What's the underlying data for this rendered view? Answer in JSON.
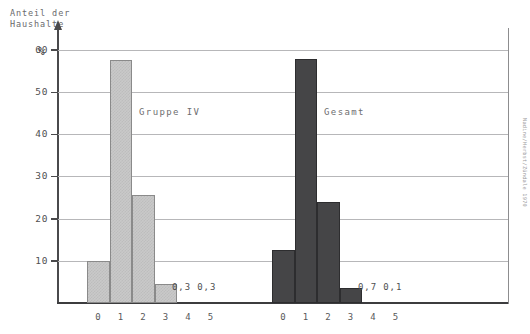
{
  "axis": {
    "y_title_line1": "Anteil der",
    "y_title_line2": "Haushalte",
    "y_unit": "%",
    "y_ticks": [
      "60",
      "50",
      "40",
      "30",
      "20",
      "10"
    ],
    "x_ticks": [
      "0",
      "1",
      "2",
      "3",
      "4",
      "5"
    ]
  },
  "groups": {
    "left": {
      "label": "Gruppe IV",
      "small_values_text": "0,3  0,3"
    },
    "right": {
      "label": "Gesamt",
      "small_values_text": "0,7  0,1"
    }
  },
  "credit": "Nadine/Herbst/Zündale 1970",
  "colors": {
    "light_bar": "#c9c9c9",
    "light_bar_border": "#8a8a8a",
    "dark_bar": "#454547",
    "dark_bar_border": "#2d2d2f",
    "gridline": "#b7b7b9",
    "axis": "#4a4a4c",
    "text": "#58585a"
  },
  "chart_data": {
    "type": "bar",
    "title": "",
    "xlabel": "",
    "ylabel": "Anteil der Haushalte %",
    "ylim": [
      0,
      62
    ],
    "grid": true,
    "legend_position": "inline-annotation",
    "categories": [
      "0",
      "1",
      "2",
      "3",
      "4",
      "5"
    ],
    "series": [
      {
        "name": "Gruppe IV",
        "values": [
          10.0,
          57.5,
          25.5,
          4.5,
          0.3,
          0.3
        ],
        "color": "#c9c9c9",
        "annotations": [
          "",
          "",
          "",
          "",
          "0,3",
          "0,3"
        ]
      },
      {
        "name": "Gesamt",
        "values": [
          12.5,
          57.8,
          24.0,
          3.5,
          0.7,
          0.1
        ],
        "color": "#454547",
        "annotations": [
          "",
          "",
          "",
          "",
          "0,7",
          "0,1"
        ]
      }
    ]
  }
}
